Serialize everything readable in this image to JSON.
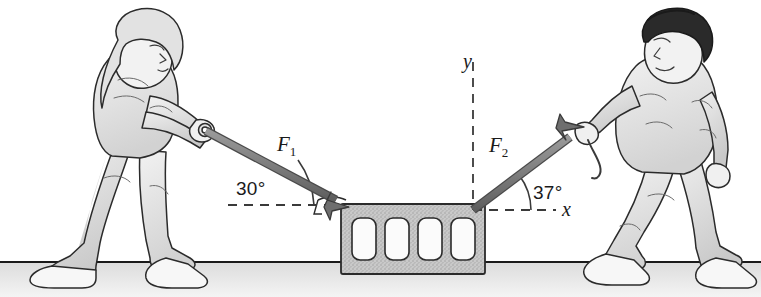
{
  "figure": {
    "background_color": "#ffffff",
    "ground_line_color": "#1a1a1a",
    "floor_color": "#e8e8e8"
  },
  "labels": {
    "force1": "F",
    "force1_sub": "1",
    "force2": "F",
    "force2_sub": "2",
    "angle1": "30°",
    "angle2": "37°",
    "axis_x": "x",
    "axis_y": "y"
  },
  "vectors": [
    {
      "name": "F1",
      "label": "F1",
      "angle_deg": 30,
      "direction": "down-right",
      "description": "Force applied by the woman pulling the block toward the lower right",
      "color": "#7d7d7d",
      "outline_color": "#4a4a4a",
      "start": [
        206,
        131
      ],
      "end": [
        345,
        205
      ]
    },
    {
      "name": "F2",
      "label": "F2",
      "angle_deg": 37,
      "direction": "up-right",
      "description": "Force applied by the man pulling the block toward the upper right",
      "color": "#7d7d7d",
      "outline_color": "#4a4a4a",
      "start": [
        473,
        210
      ],
      "end": [
        582,
        128
      ]
    }
  ],
  "axes": {
    "origin": [
      473,
      210
    ],
    "style": "dashed",
    "color": "#3a3a3a",
    "x_label": "x",
    "y_label": "y",
    "y_top": [
      473,
      62
    ],
    "x_right": [
      556,
      210
    ]
  },
  "objects": [
    {
      "name": "woman",
      "role": "person pulling left rope",
      "description": "Woman leaning forward, both hands gripping a handle"
    },
    {
      "name": "man",
      "role": "person pulling right rope",
      "description": "Man with dark hair, left hand gripping a rope"
    },
    {
      "name": "crate",
      "role": "concrete block",
      "description": "Textured gray cinder block with four rounded rectangular holes",
      "holes": 4
    }
  ]
}
